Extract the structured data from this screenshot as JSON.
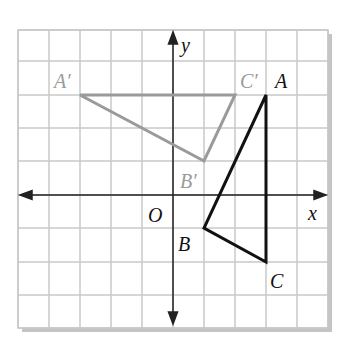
{
  "diagram": {
    "type": "coordinate-plane",
    "grid": {
      "x_min": -5,
      "x_max": 5,
      "y_min": -4,
      "y_max": 5,
      "cell_px": 31
    },
    "axes": {
      "x_label": "x",
      "y_label": "y",
      "origin_label": "O"
    },
    "triangles": [
      {
        "name": "original",
        "color": "#111111",
        "vertices": [
          {
            "label": "A",
            "x": 3,
            "y": 3
          },
          {
            "label": "B",
            "x": 1,
            "y": -1
          },
          {
            "label": "C",
            "x": 3,
            "y": -2
          }
        ]
      },
      {
        "name": "image",
        "color": "#9a9a9a",
        "vertices": [
          {
            "label": "A′",
            "x": -3,
            "y": 3
          },
          {
            "label": "B′",
            "x": 1,
            "y": 1
          },
          {
            "label": "C′",
            "x": 2,
            "y": 3
          }
        ]
      }
    ],
    "colors": {
      "grid": "#c8c8c8",
      "axis": "#222222",
      "shadow": "#bdbdbd",
      "image_label": "#9a9a9a",
      "label": "#111111"
    }
  }
}
